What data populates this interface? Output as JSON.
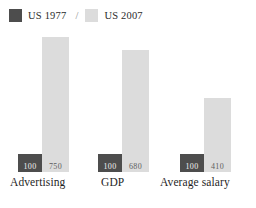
{
  "legend": {
    "separator": "/",
    "entries": [
      {
        "label": "US 1977",
        "swatch": "dark-swatch-icon",
        "color": "#4d4d4d"
      },
      {
        "label": "US 2007",
        "swatch": "light-swatch-icon",
        "color": "#dcdcdc"
      }
    ]
  },
  "chart_data": {
    "type": "bar",
    "title": "",
    "subtitle": "",
    "xlabel": "",
    "ylabel": "",
    "grid": false,
    "legend_position": "top-left",
    "ylim": [
      0,
      800
    ],
    "categories": [
      "Advertising",
      "GDP",
      "Average salary"
    ],
    "series": [
      {
        "name": "US 1977",
        "color": "#4d4d4d",
        "values": [
          100,
          100,
          100
        ],
        "labels": [
          "100",
          "100",
          "100"
        ]
      },
      {
        "name": "US 2007",
        "color": "#dcdcdc",
        "values": [
          750,
          680,
          410
        ],
        "labels": [
          "750",
          "680",
          "410"
        ]
      }
    ]
  }
}
